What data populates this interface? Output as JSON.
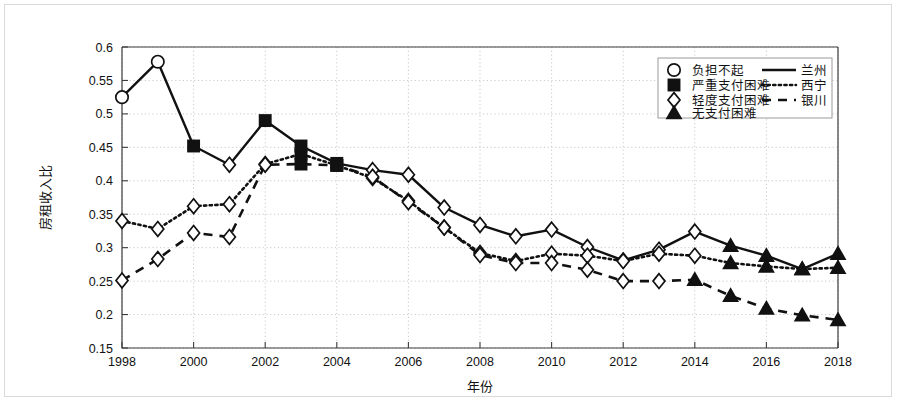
{
  "chart_data": {
    "type": "line",
    "title": "",
    "xlabel": "年份",
    "ylabel": "房租收入比",
    "xlim": [
      1998,
      2018
    ],
    "ylim": [
      0.15,
      0.6
    ],
    "ytick_step": 0.05,
    "xtick_step": 2,
    "grid": true,
    "legend_position": "top-right",
    "x": [
      1998,
      1999,
      2000,
      2001,
      2002,
      2003,
      2004,
      2005,
      2006,
      2007,
      2008,
      2009,
      2010,
      2011,
      2012,
      2013,
      2014,
      2015,
      2016,
      2017,
      2018
    ],
    "xticks": [
      "1998",
      "2000",
      "2002",
      "2004",
      "2006",
      "2008",
      "2010",
      "2012",
      "2014",
      "2016",
      "2018"
    ],
    "yticks": [
      "0.15",
      "0.2",
      "0.25",
      "0.3",
      "0.35",
      "0.4",
      "0.45",
      "0.5",
      "0.55",
      "0.6"
    ],
    "series": [
      {
        "name": "兰州",
        "linestyle": "solid",
        "values": [
          0.525,
          0.578,
          0.452,
          0.424,
          0.49,
          0.452,
          0.426,
          0.416,
          0.409,
          0.36,
          0.334,
          0.317,
          0.327,
          0.301,
          0.281,
          0.297,
          0.324,
          0.303,
          0.288,
          0.268,
          0.291
        ],
        "markers": [
          "circle",
          "circle",
          "square",
          "diamond",
          "square",
          "square",
          "square",
          "diamond",
          "diamond",
          "diamond",
          "diamond",
          "diamond",
          "diamond",
          "diamond",
          "diamond",
          "diamond",
          "diamond",
          "triangle",
          "triangle",
          "triangle",
          "triangle"
        ]
      },
      {
        "name": "西宁",
        "linestyle": "dotted",
        "values": [
          0.34,
          0.328,
          0.362,
          0.365,
          0.425,
          0.44,
          0.423,
          0.404,
          0.37,
          0.33,
          0.292,
          0.28,
          0.291,
          0.288,
          0.28,
          0.291,
          0.288,
          0.277,
          0.272,
          0.268,
          0.27
        ],
        "markers": [
          "diamond",
          "diamond",
          "diamond",
          "diamond",
          "diamond",
          "square",
          "square",
          "diamond",
          "diamond",
          "diamond",
          "diamond",
          "diamond",
          "diamond",
          "diamond",
          "diamond",
          "diamond",
          "diamond",
          "triangle",
          "triangle",
          "triangle",
          "triangle"
        ]
      },
      {
        "name": "银川",
        "linestyle": "dashed",
        "values": [
          0.251,
          0.283,
          0.322,
          0.316,
          0.424,
          0.425,
          0.423,
          0.406,
          0.368,
          0.33,
          0.289,
          0.277,
          0.277,
          0.267,
          0.25,
          0.25,
          0.252,
          0.228,
          0.209,
          0.199,
          0.192
        ],
        "markers": [
          "diamond",
          "diamond",
          "diamond",
          "diamond",
          "diamond",
          "square",
          "square",
          "diamond",
          "diamond",
          "diamond",
          "diamond",
          "diamond",
          "diamond",
          "diamond",
          "diamond",
          "diamond",
          "triangle",
          "triangle",
          "triangle",
          "triangle",
          "triangle"
        ]
      }
    ]
  },
  "legend": {
    "markers": [
      {
        "label": "负担不起",
        "marker": "circle"
      },
      {
        "label": "严重支付困难",
        "marker": "square"
      },
      {
        "label": "轻度支付困难",
        "marker": "diamond"
      },
      {
        "label": "无支付困难",
        "marker": "triangle"
      }
    ],
    "lines": [
      {
        "label": "兰州",
        "linestyle": "solid"
      },
      {
        "label": "西宁",
        "linestyle": "dotted"
      },
      {
        "label": "银川",
        "linestyle": "dashed"
      }
    ]
  },
  "colors": {
    "ink": "#111111",
    "grid": "#c9c9c9",
    "axis": "#3c3c3c",
    "background": "#ffffff"
  }
}
